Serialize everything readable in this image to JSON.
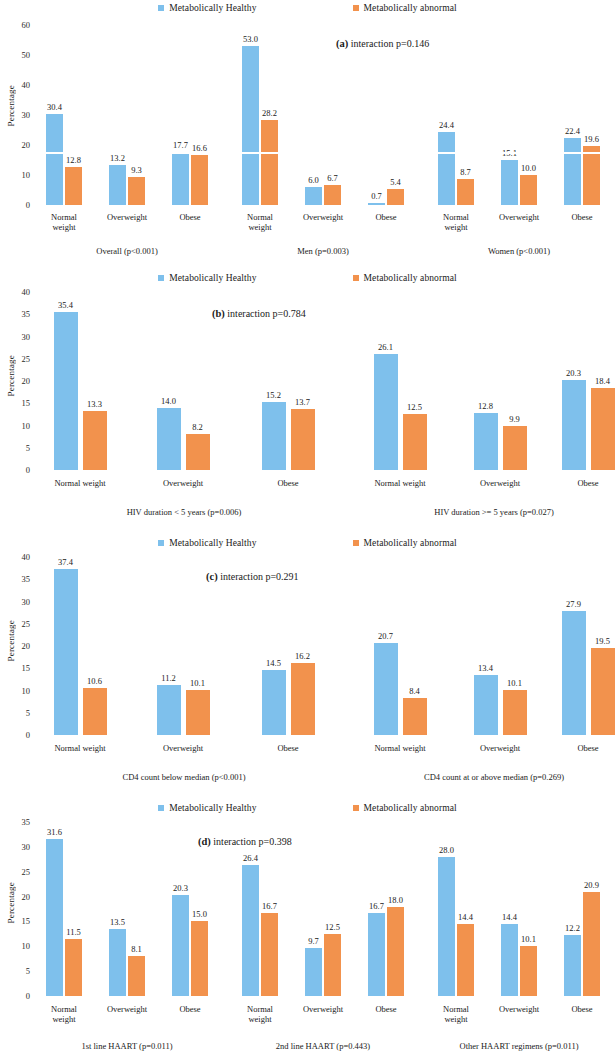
{
  "figure": {
    "ylabel": "Percentage",
    "legend": [
      {
        "label": "Metabolically Healthy",
        "color": "#7EC0EC",
        "key": "healthy"
      },
      {
        "label": "Metabolically abnormal",
        "color": "#F2924D",
        "key": "abnormal"
      }
    ]
  },
  "chart_data": [
    {
      "type": "bar",
      "panel": "a",
      "title_prefix": "(a)",
      "title": "interaction p=0.146",
      "ylabel": "Percentage",
      "ylim": [
        0,
        60
      ],
      "yticks": [
        0,
        10,
        20,
        30,
        40,
        50,
        60
      ],
      "grid": false,
      "legend_position": "top-center",
      "categories": [
        "Normal weight",
        "Overweight",
        "Obese",
        "Normal weight",
        "Overweight",
        "Obese",
        "Normal weight",
        "Overweight",
        "Obese"
      ],
      "groups": [
        {
          "label": "Overall (p<0.001)",
          "span": 3
        },
        {
          "label": "Men (p=0.003)",
          "span": 3
        },
        {
          "label": "Women (p<0.001)",
          "span": 3
        }
      ],
      "series": [
        {
          "name": "Metabolically Healthy",
          "color": "#7EC0EC",
          "values": [
            30.4,
            13.2,
            17.7,
            53.0,
            6.0,
            0.7,
            24.4,
            15.1,
            22.4
          ]
        },
        {
          "name": "Metabolically abnormal",
          "color": "#F2924D",
          "values": [
            12.8,
            9.3,
            16.6,
            28.2,
            6.7,
            5.4,
            8.7,
            10.0,
            19.6
          ]
        }
      ]
    },
    {
      "type": "bar",
      "panel": "b",
      "title_prefix": "(b)",
      "title": "interaction p=0.784",
      "ylabel": "Percentage",
      "ylim": [
        0,
        40
      ],
      "yticks": [
        0,
        5,
        10,
        15,
        20,
        25,
        30,
        35,
        40
      ],
      "grid": false,
      "legend_position": "top-center",
      "categories": [
        "Normal weight",
        "Overweight",
        "Obese",
        "Normal weight",
        "Overweight",
        "Obese"
      ],
      "groups": [
        {
          "label": "HIV duration < 5 years (p=0.006)",
          "span": 3
        },
        {
          "label": "HIV duration >= 5 years (p=0.027)",
          "span": 3
        }
      ],
      "series": [
        {
          "name": "Metabolically Healthy",
          "color": "#7EC0EC",
          "values": [
            35.4,
            14.0,
            15.2,
            26.1,
            12.8,
            20.3
          ]
        },
        {
          "name": "Metabolically abnormal",
          "color": "#F2924D",
          "values": [
            13.3,
            8.2,
            13.7,
            12.5,
            9.9,
            18.4
          ]
        }
      ]
    },
    {
      "type": "bar",
      "panel": "c",
      "title_prefix": "(c)",
      "title": "interaction p=0.291",
      "ylabel": "Percentage",
      "ylim": [
        0,
        40
      ],
      "yticks": [
        0,
        5,
        10,
        15,
        20,
        25,
        30,
        35,
        40
      ],
      "grid": false,
      "legend_position": "top-center",
      "categories": [
        "Normal weight",
        "Overweight",
        "Obese",
        "Normal weight",
        "Overweight",
        "Obese"
      ],
      "groups": [
        {
          "label": "CD4 count below median (p<0.001)",
          "span": 3
        },
        {
          "label": "CD4 count at or above median (p=0.269)",
          "span": 3
        }
      ],
      "series": [
        {
          "name": "Metabolically Healthy",
          "color": "#7EC0EC",
          "values": [
            37.4,
            11.2,
            14.5,
            20.7,
            13.4,
            27.9
          ]
        },
        {
          "name": "Metabolically abnormal",
          "color": "#F2924D",
          "values": [
            10.6,
            10.1,
            16.2,
            8.4,
            10.1,
            19.5
          ]
        }
      ]
    },
    {
      "type": "bar",
      "panel": "d",
      "title_prefix": "(d)",
      "title": "interaction p=0.398",
      "ylabel": "Percentage",
      "ylim": [
        0,
        35
      ],
      "yticks": [
        0,
        5,
        10,
        15,
        20,
        25,
        30,
        35
      ],
      "grid": false,
      "legend_position": "top-center",
      "categories": [
        "Normal weight",
        "Overweight",
        "Obese",
        "Normal weight",
        "Overweight",
        "Obese",
        "Normal weight",
        "Overweight",
        "Obese"
      ],
      "groups": [
        {
          "label": "1st line HAART (p=0.011)",
          "span": 3
        },
        {
          "label": "2nd line HAART (p=0.443)",
          "span": 3
        },
        {
          "label": "Other HAART regimens (p=0.011)",
          "span": 3
        }
      ],
      "series": [
        {
          "name": "Metabolically Healthy",
          "color": "#7EC0EC",
          "values": [
            31.6,
            13.5,
            20.3,
            26.4,
            9.7,
            16.7,
            28.0,
            14.4,
            12.2
          ]
        },
        {
          "name": "Metabolically abnormal",
          "color": "#F2924D",
          "values": [
            11.5,
            8.1,
            15.0,
            16.7,
            12.5,
            18.0,
            14.4,
            10.1,
            20.9
          ]
        }
      ]
    }
  ]
}
